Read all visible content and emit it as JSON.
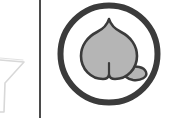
{
  "canvas": {
    "width": 171,
    "height": 118,
    "background_color": "#ffffff"
  },
  "colors": {
    "background": "#ffffff",
    "divider": "#4b4b4b",
    "circle_stroke": "#3b3b3b",
    "peach_fill": "#b5b5b5",
    "peach_stroke": "#3b3b3b",
    "leaf_fill": "#b5b5b5",
    "ghost_outline": "#d8d8d8"
  },
  "left_pane": {
    "name": "clipped-adjacent-glyph",
    "description": "faint light-gray funnel-shaped outline clipped by the left edge",
    "stroke_color": "#d8d8d8"
  },
  "divider": {
    "name": "vertical-divider",
    "orientation": "vertical",
    "x": 39,
    "thickness_px": 2,
    "color": "#4b4b4b"
  },
  "right_pane": {
    "badge": {
      "shape": "circle",
      "diameter_px": 104,
      "stroke_width_px": 6,
      "stroke_color": "#3b3b3b",
      "fill": "#ffffff",
      "icon": {
        "semantic_name": "peach-icon",
        "label": "Peach",
        "fill_color": "#b5b5b5",
        "stroke_color": "#3b3b3b",
        "parts": [
          "body",
          "cleft",
          "leaf",
          "stem-point"
        ]
      }
    }
  }
}
